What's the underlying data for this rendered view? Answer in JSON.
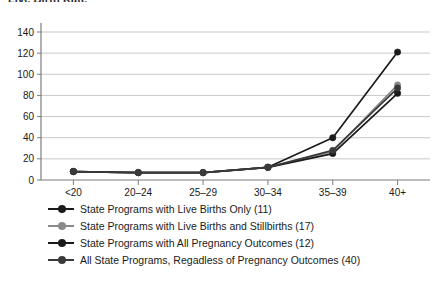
{
  "chart_title": "Live Birth Rate",
  "chart_data": {
    "type": "line",
    "title": "Live Birth Rate",
    "xlabel": "",
    "ylabel": "",
    "ylim": [
      0,
      140
    ],
    "ytick_step": 20,
    "yticks": [
      "0",
      "20",
      "40",
      "60",
      "80",
      "100",
      "120",
      "140"
    ],
    "grid": true,
    "legend_position": "below",
    "categories": [
      "<20",
      "20–24",
      "25–29",
      "30–34",
      "35–39",
      "40+"
    ],
    "series": [
      {
        "name": "State Programs with Live Births Only (11)",
        "color": "#1a1a1a",
        "values": [
          8,
          7,
          7,
          12,
          40,
          121
        ]
      },
      {
        "name": "State Programs with Live Births and Stillbirths (17)",
        "color": "#8a8a8a",
        "values": [
          8,
          7,
          7,
          12,
          27,
          90
        ]
      },
      {
        "name": "State Programs with All Pregnancy Outcomes (12)",
        "color": "#1a1a1a",
        "values": [
          8,
          7,
          7,
          12,
          25,
          82
        ]
      },
      {
        "name": "All State Programs, Regadless of Pregnancy Outcomes (40)",
        "color": "#3a3a3a",
        "values": [
          8,
          7,
          7,
          12,
          28,
          87
        ]
      }
    ]
  },
  "legend": {
    "items": [
      {
        "label": "State Programs with Live Births Only (11)",
        "color": "#1a1a1a"
      },
      {
        "label": "State Programs with Live Births and Stillbirths (17)",
        "color": "#8a8a8a"
      },
      {
        "label": "State Programs with All Pregnancy Outcomes (12)",
        "color": "#1a1a1a"
      },
      {
        "label": "All State Programs, Regadless of Pregnancy Outcomes (40)",
        "color": "#3a3a3a"
      }
    ]
  },
  "colors": {
    "gridline": "#c9c9c9",
    "axis": "#7d7d7d",
    "text": "#1a1a1a",
    "background": "#ffffff"
  }
}
